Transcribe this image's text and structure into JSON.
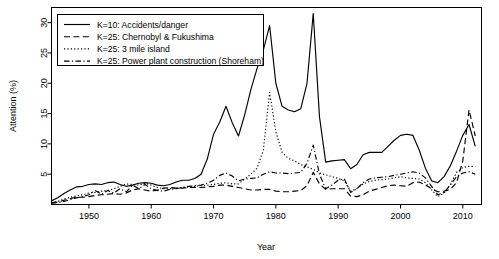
{
  "chart_data": {
    "type": "line",
    "title": "",
    "xlabel": "Year",
    "ylabel": "Attention (%)",
    "xlim": [
      1944,
      2013
    ],
    "ylim": [
      0,
      32.5
    ],
    "xticks": [
      1950,
      1960,
      1970,
      1980,
      1990,
      2000,
      2010
    ],
    "xticklabels": [
      "1950",
      "1960",
      "1970",
      "1980",
      "1990",
      "2000",
      "2010"
    ],
    "yticks": [
      5,
      10,
      15,
      20,
      25,
      30
    ],
    "yticklabels": [
      "5",
      "10",
      "15",
      "20",
      "25",
      "30"
    ],
    "grid": false,
    "legend_position": "top-left",
    "x": [
      1944,
      1945,
      1946,
      1947,
      1948,
      1949,
      1950,
      1951,
      1952,
      1953,
      1954,
      1955,
      1956,
      1957,
      1958,
      1959,
      1960,
      1961,
      1962,
      1963,
      1964,
      1965,
      1966,
      1967,
      1968,
      1969,
      1970,
      1971,
      1972,
      1973,
      1974,
      1975,
      1976,
      1977,
      1978,
      1979,
      1980,
      1981,
      1982,
      1983,
      1984,
      1985,
      1986,
      1987,
      1988,
      1989,
      1990,
      1991,
      1992,
      1993,
      1994,
      1995,
      1996,
      1997,
      1998,
      1999,
      2000,
      2001,
      2002,
      2003,
      2004,
      2005,
      2006,
      2007,
      2008,
      2009,
      2010,
      2011,
      2012
    ],
    "series": [
      {
        "name": "K=10: Accidents/danger",
        "style": "solid",
        "values": [
          0.6,
          1.1,
          1.8,
          2.4,
          2.9,
          3.0,
          3.3,
          3.4,
          3.3,
          3.6,
          3.7,
          3.3,
          3.0,
          3.2,
          3.5,
          3.6,
          3.5,
          3.2,
          3.1,
          3.3,
          3.7,
          4.0,
          4.0,
          4.3,
          5.0,
          7.5,
          11.6,
          13.6,
          16.2,
          13.5,
          11.3,
          14.8,
          19.0,
          22.5,
          25.5,
          29.5,
          20.0,
          16.2,
          15.6,
          15.3,
          15.8,
          20.0,
          31.5,
          14.5,
          7.0,
          7.2,
          7.3,
          7.4,
          5.9,
          6.6,
          8.2,
          8.6,
          8.6,
          8.6,
          9.6,
          10.6,
          11.4,
          11.6,
          11.4,
          9.0,
          6.0,
          3.9,
          3.6,
          4.6,
          6.4,
          8.8,
          11.4,
          13.2,
          9.6
        ]
      },
      {
        "name": "K=25: Chernobyl & Fukushima",
        "style": "dashed",
        "values": [
          0.3,
          0.4,
          0.7,
          1.0,
          1.2,
          1.2,
          1.3,
          1.5,
          1.6,
          1.7,
          1.8,
          1.7,
          1.9,
          2.4,
          2.6,
          2.4,
          2.2,
          2.4,
          2.7,
          2.8,
          2.7,
          2.7,
          2.8,
          2.8,
          2.8,
          2.9,
          3.0,
          3.2,
          3.2,
          3.0,
          2.8,
          2.6,
          2.4,
          2.4,
          2.5,
          2.5,
          2.2,
          2.1,
          2.1,
          2.2,
          2.3,
          3.1,
          5.3,
          3.4,
          2.5,
          2.6,
          2.6,
          2.6,
          1.4,
          1.3,
          1.6,
          2.2,
          2.5,
          2.8,
          3.1,
          3.2,
          3.1,
          3.0,
          3.6,
          3.7,
          3.2,
          2.6,
          2.1,
          2.2,
          2.5,
          3.6,
          7.2,
          15.6,
          11.3
        ]
      },
      {
        "name": "K=25: 3 mile island",
        "style": "dotted",
        "values": [
          0.3,
          0.5,
          0.9,
          1.2,
          1.4,
          1.6,
          1.9,
          2.0,
          2.2,
          2.3,
          2.6,
          3.0,
          3.4,
          3.3,
          3.2,
          3.5,
          3.2,
          2.8,
          2.6,
          2.6,
          2.7,
          2.8,
          2.9,
          3.0,
          3.1,
          3.2,
          3.3,
          3.5,
          3.6,
          3.4,
          3.4,
          4.2,
          5.0,
          6.0,
          9.0,
          18.5,
          12.0,
          8.6,
          7.6,
          7.2,
          6.6,
          6.2,
          5.8,
          5.2,
          4.9,
          4.6,
          4.3,
          3.9,
          2.2,
          2.6,
          3.4,
          3.8,
          4.0,
          4.1,
          4.2,
          4.4,
          4.6,
          4.4,
          4.3,
          4.2,
          3.6,
          2.4,
          1.3,
          1.9,
          3.3,
          5.3,
          6.1,
          6.3,
          6.3
        ]
      },
      {
        "name": "K=25: Power plant construction (Shoreham)",
        "style": "dashdot",
        "values": [
          0.2,
          0.3,
          0.5,
          0.8,
          1.1,
          1.3,
          1.6,
          2.3,
          1.7,
          2.3,
          1.9,
          2.6,
          2.1,
          3.2,
          2.6,
          3.3,
          2.6,
          2.3,
          2.2,
          2.5,
          2.6,
          2.8,
          3.0,
          3.1,
          3.2,
          3.5,
          4.0,
          4.8,
          5.2,
          4.7,
          3.9,
          4.2,
          4.3,
          4.4,
          5.0,
          5.4,
          5.2,
          5.2,
          5.1,
          5.2,
          5.3,
          6.8,
          9.8,
          5.0,
          2.6,
          3.2,
          4.0,
          4.2,
          2.0,
          2.6,
          3.6,
          4.2,
          4.4,
          4.5,
          4.6,
          4.8,
          5.0,
          5.2,
          5.4,
          5.2,
          4.4,
          3.0,
          1.6,
          2.0,
          3.2,
          4.6,
          5.2,
          5.4,
          5.0
        ]
      }
    ]
  },
  "legend": {
    "items": [
      {
        "label": "K=10: Accidents/danger",
        "style": "solid"
      },
      {
        "label": "K=25: Chernobyl & Fukushima",
        "style": "dashed"
      },
      {
        "label": "K=25: 3 mile island",
        "style": "dotted"
      },
      {
        "label": "K=25: Power plant construction (Shoreham)",
        "style": "dashdot"
      }
    ]
  },
  "colors": {
    "ink": "#000000",
    "background": "#ffffff"
  }
}
